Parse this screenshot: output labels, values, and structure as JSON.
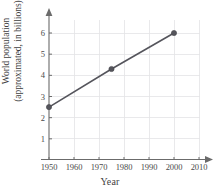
{
  "chart_data": {
    "type": "line",
    "title": "",
    "xlabel": "Year",
    "ylabel_line1": "World population",
    "ylabel_line2": "(approximated, in billions)",
    "x": [
      1950,
      1975,
      2000
    ],
    "values": [
      2.5,
      4.3,
      6.0
    ],
    "xlim": [
      1945,
      2013
    ],
    "ylim": [
      0,
      6.6
    ],
    "xticks": [
      1950,
      1960,
      1970,
      1980,
      1990,
      2000,
      2010
    ],
    "yticks": [
      1,
      2,
      3,
      4,
      5,
      6
    ],
    "xtick_labels": [
      "1950",
      "1960",
      "1970",
      "1980",
      "1990",
      "2000",
      "2010"
    ],
    "ytick_labels": [
      "1",
      "2",
      "3",
      "4",
      "5",
      "6"
    ],
    "grid": true,
    "legend": "none",
    "markers": "filled-circle",
    "axis_arrows": true,
    "colors": {
      "line": "#55555c",
      "marker": "#55555c",
      "axis": "#6b6b6b",
      "grid": "#e3e3e6",
      "text": "#3f3f3f",
      "background": "#ffffff"
    }
  }
}
